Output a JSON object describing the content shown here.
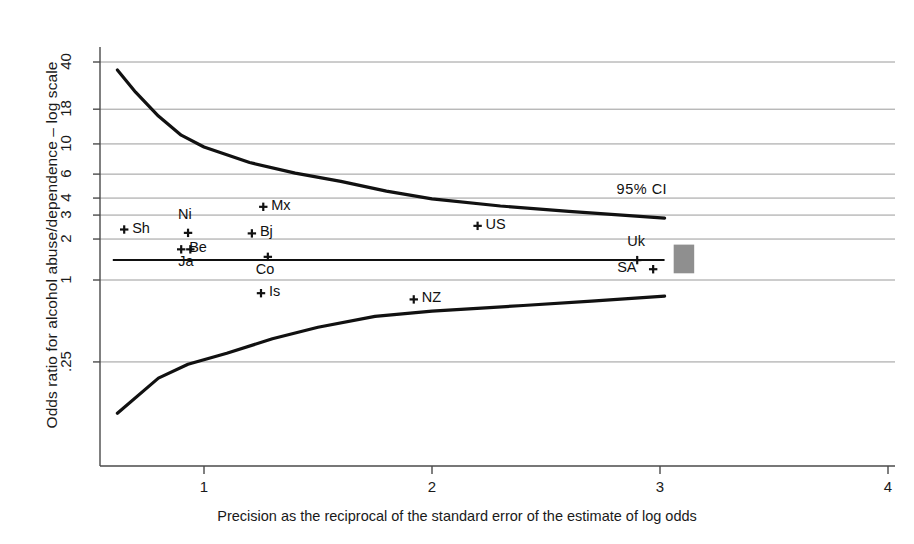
{
  "chart_data": {
    "type": "scatter",
    "title": "",
    "subtitle": "",
    "xlabel": "Precision as the reciprocal of the standard error of the estimate of log odds",
    "ylabel": "Odds ratio for alcohol abuse/dependence – log scale",
    "x_ticks": [
      "1",
      "2",
      "3",
      "4"
    ],
    "x_tick_values": [
      1,
      2,
      3,
      4
    ],
    "xlim": [
      0.55,
      4.05
    ],
    "y_ticks": [
      ".25",
      "1",
      "2",
      "3",
      "4",
      "6",
      "10",
      "18",
      "40"
    ],
    "y_tick_values": [
      0.25,
      1,
      2,
      3,
      4,
      6,
      10,
      18,
      40
    ],
    "ylim": [
      0.06,
      60
    ],
    "y_scale": "log",
    "grid": "horizontal",
    "legend": "none",
    "annotations": [
      {
        "text": "95% CI",
        "x": 2.95,
        "y": 4.6
      }
    ],
    "reference_line": {
      "label": "pooled estimate",
      "y": 1.4,
      "x_start": 0.6,
      "x_end": 3.02
    },
    "points": [
      {
        "label": "Sh",
        "x": 0.65,
        "y": 2.35,
        "label_side": "right"
      },
      {
        "label": "Ni",
        "x": 0.93,
        "y": 2.22,
        "label_side": "above"
      },
      {
        "label": "Be",
        "x": 0.9,
        "y": 1.68,
        "label_side": "right"
      },
      {
        "label": "Ja",
        "x": 0.94,
        "y": 1.68,
        "label_side": "below"
      },
      {
        "label": "Mx",
        "x": 1.26,
        "y": 3.45,
        "label_side": "right"
      },
      {
        "label": "Bj",
        "x": 1.21,
        "y": 2.2,
        "label_side": "right"
      },
      {
        "label": "Co",
        "x": 1.28,
        "y": 1.48,
        "label_side": "below"
      },
      {
        "label": "Is",
        "x": 1.25,
        "y": 0.8,
        "label_side": "right"
      },
      {
        "label": "US",
        "x": 2.2,
        "y": 2.5,
        "label_side": "right"
      },
      {
        "label": "NZ",
        "x": 1.92,
        "y": 0.72,
        "label_side": "right"
      },
      {
        "label": "Uk",
        "x": 2.9,
        "y": 1.4,
        "label_side": "above"
      },
      {
        "label": "SA",
        "x": 2.97,
        "y": 1.2,
        "label_side": "left"
      }
    ],
    "ci_upper_curve": [
      {
        "x": 0.62,
        "y": 35.0
      },
      {
        "x": 0.7,
        "y": 24.0
      },
      {
        "x": 0.8,
        "y": 16.0
      },
      {
        "x": 0.9,
        "y": 11.6
      },
      {
        "x": 1.0,
        "y": 9.5
      },
      {
        "x": 1.2,
        "y": 7.3
      },
      {
        "x": 1.4,
        "y": 6.1
      },
      {
        "x": 1.6,
        "y": 5.3
      },
      {
        "x": 1.8,
        "y": 4.5
      },
      {
        "x": 2.0,
        "y": 3.95
      },
      {
        "x": 2.3,
        "y": 3.5
      },
      {
        "x": 2.6,
        "y": 3.2
      },
      {
        "x": 3.02,
        "y": 2.85
      }
    ],
    "ci_lower_curve": [
      {
        "x": 0.62,
        "y": 0.105
      },
      {
        "x": 0.8,
        "y": 0.19
      },
      {
        "x": 0.93,
        "y": 0.24
      },
      {
        "x": 1.1,
        "y": 0.29
      },
      {
        "x": 1.3,
        "y": 0.37
      },
      {
        "x": 1.5,
        "y": 0.45
      },
      {
        "x": 1.75,
        "y": 0.54
      },
      {
        "x": 2.0,
        "y": 0.59
      },
      {
        "x": 2.4,
        "y": 0.65
      },
      {
        "x": 2.7,
        "y": 0.7
      },
      {
        "x": 3.02,
        "y": 0.76
      }
    ],
    "shaded_box": {
      "x_start": 3.06,
      "x_end": 3.15,
      "y_low": 1.12,
      "y_high": 1.82,
      "color": "#8f8f8f"
    },
    "colors": {
      "curve": "#111111",
      "grid": "#9a9a9a",
      "axis": "#4a4a4a",
      "marker": "#111111",
      "reference": "#111111"
    }
  }
}
